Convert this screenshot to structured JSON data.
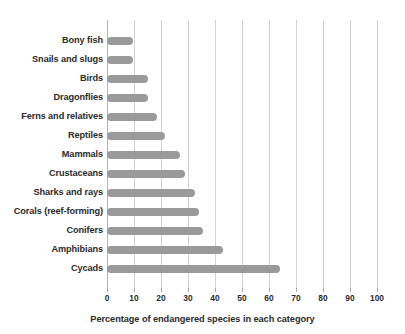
{
  "chart_data": {
    "type": "bar",
    "orientation": "horizontal",
    "title": "",
    "xlabel": "Percentage of endangered species in each category",
    "ylabel": "",
    "xlim": [
      0,
      100
    ],
    "xticks": [
      0,
      10,
      20,
      30,
      40,
      50,
      60,
      70,
      80,
      90,
      100
    ],
    "grid": true,
    "legend": false,
    "bar_color": "#9a9a9a",
    "text_color": "#2b2b2b",
    "gridline_color": "#d2d2d2",
    "categories": [
      "Bony fish",
      "Snails and slugs",
      "Birds",
      "Dragonflies",
      "Ferns and relatives",
      "Reptiles",
      "Mammals",
      "Crustaceans",
      "Sharks and rays",
      "Corals (reef-forming)",
      "Conifers",
      "Amphibians",
      "Cycads"
    ],
    "values": [
      9.5,
      9.5,
      15,
      15,
      18.5,
      21.5,
      27,
      29,
      32.5,
      34,
      35.5,
      43,
      64
    ]
  }
}
